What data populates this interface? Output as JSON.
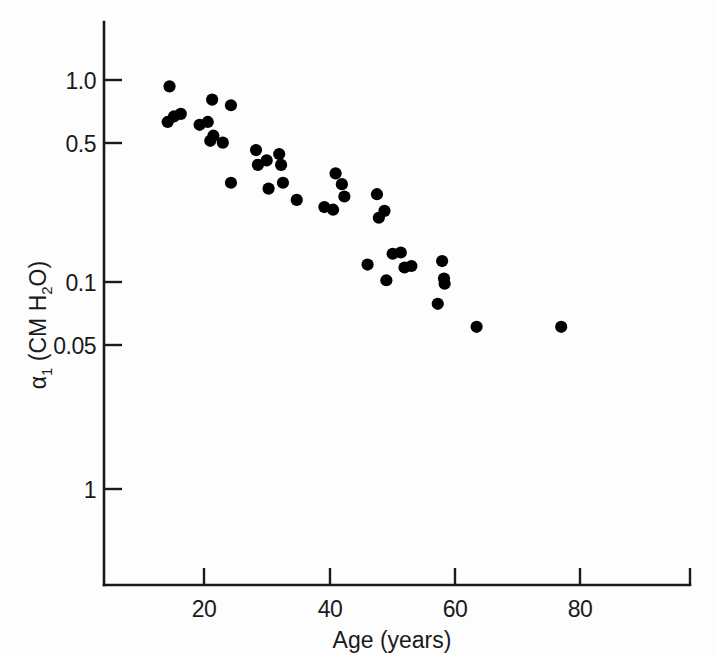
{
  "figure": {
    "background_color": "#fdfdfd",
    "ink_color": "#1a1a1a",
    "marker_color": "#000000"
  },
  "axes": {
    "x": {
      "title": "Age (years)",
      "tick_labels": [
        "20",
        "40",
        "60",
        "80"
      ],
      "tick_values": [
        20,
        40,
        60,
        80
      ],
      "range": [
        4,
        97
      ],
      "tick_direction": "in"
    },
    "y": {
      "title_parts": {
        "symbol": "α",
        "subscript": "1",
        "units": " (CM H",
        "units_subscript": "2",
        "units_tail": "O)"
      },
      "title": "α1 (CM H2O)",
      "tick_labels": [
        "1.0",
        "0.5",
        "0.1",
        "0.05",
        "1"
      ],
      "tick_values": [
        1.0,
        0.5,
        0.1,
        0.05,
        0.01
      ],
      "scale": "log",
      "tick_direction": "in"
    }
  },
  "chart_data": {
    "type": "scatter",
    "title": "",
    "xlabel": "Age (years)",
    "ylabel": "α1 (CM H2O)",
    "xlim": [
      4,
      97
    ],
    "ylim": [
      0.004,
      1.45
    ],
    "yscale": "log",
    "grid": false,
    "legend": "none",
    "series": [
      {
        "name": "alpha1 vs age",
        "marker": "filled-circle",
        "color": "#000000",
        "points": [
          {
            "x": 14.5,
            "y": 0.93
          },
          {
            "x": 14.2,
            "y": 0.62
          },
          {
            "x": 15.2,
            "y": 0.66
          },
          {
            "x": 16.3,
            "y": 0.68
          },
          {
            "x": 19.3,
            "y": 0.6
          },
          {
            "x": 20.6,
            "y": 0.62
          },
          {
            "x": 21.3,
            "y": 0.8
          },
          {
            "x": 21.5,
            "y": 0.53
          },
          {
            "x": 21.0,
            "y": 0.5
          },
          {
            "x": 23.0,
            "y": 0.49
          },
          {
            "x": 24.3,
            "y": 0.75
          },
          {
            "x": 24.3,
            "y": 0.31
          },
          {
            "x": 28.3,
            "y": 0.45
          },
          {
            "x": 28.6,
            "y": 0.38
          },
          {
            "x": 30.0,
            "y": 0.4
          },
          {
            "x": 30.3,
            "y": 0.29
          },
          {
            "x": 32.0,
            "y": 0.43
          },
          {
            "x": 32.3,
            "y": 0.38
          },
          {
            "x": 32.6,
            "y": 0.31
          },
          {
            "x": 34.8,
            "y": 0.255
          },
          {
            "x": 39.2,
            "y": 0.235
          },
          {
            "x": 40.6,
            "y": 0.228
          },
          {
            "x": 41.0,
            "y": 0.345
          },
          {
            "x": 42.0,
            "y": 0.305
          },
          {
            "x": 42.4,
            "y": 0.265
          },
          {
            "x": 46.1,
            "y": 0.122
          },
          {
            "x": 47.6,
            "y": 0.272
          },
          {
            "x": 47.9,
            "y": 0.208
          },
          {
            "x": 48.8,
            "y": 0.225
          },
          {
            "x": 49.1,
            "y": 0.102
          },
          {
            "x": 50.1,
            "y": 0.138
          },
          {
            "x": 51.4,
            "y": 0.14
          },
          {
            "x": 52.0,
            "y": 0.118
          },
          {
            "x": 53.1,
            "y": 0.12
          },
          {
            "x": 57.3,
            "y": 0.078
          },
          {
            "x": 58.0,
            "y": 0.127
          },
          {
            "x": 58.3,
            "y": 0.104
          },
          {
            "x": 58.4,
            "y": 0.098
          },
          {
            "x": 63.5,
            "y": 0.06
          },
          {
            "x": 77.0,
            "y": 0.06
          }
        ]
      }
    ]
  }
}
